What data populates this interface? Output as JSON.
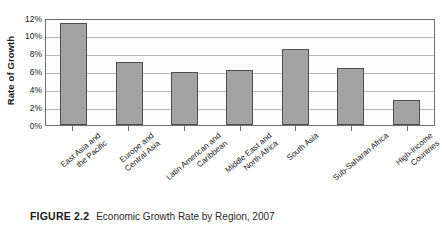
{
  "figure": {
    "number_label": "FIGURE 2.2",
    "caption_text": "Economic Growth Rate by Region, 2007"
  },
  "colors": {
    "bar_fill": "#a3a3a3",
    "bar_stroke": "#4d4d4d",
    "gridline": "#b9b9b9",
    "axis": "#6e6e6e",
    "plot_background": "#fdfdfd",
    "text": "#1b1b1b"
  },
  "chart_data": {
    "type": "bar",
    "title": "Economic Growth Rate by Region, 2007",
    "xlabel": "",
    "ylabel": "Rate of Growth",
    "ylim": [
      0,
      12
    ],
    "ytick_labels": [
      "12%",
      "10%",
      "8%",
      "6%",
      "4%",
      "2%",
      "0%"
    ],
    "ytick_values": [
      12,
      10,
      8,
      6,
      4,
      2,
      0
    ],
    "grid": true,
    "legend": false,
    "value_unit": "percent",
    "categories": [
      "East Asia and the Pacific",
      "Europe and Central Asia",
      "Latin American and Caribbean",
      "Middle East and North Africa",
      "South Asia",
      "Sub-Saharan Africa",
      "High-Income Countries"
    ],
    "category_lines": [
      [
        "East Asia and",
        "the Pacific"
      ],
      [
        "Europe and",
        "Central Asia"
      ],
      [
        "Latin American and",
        "Caribbean"
      ],
      [
        "Middle East and",
        "North Africa"
      ],
      [
        "South Asia",
        ""
      ],
      [
        "Sub-Saharan Africa",
        ""
      ],
      [
        "High-Income",
        "Countries"
      ]
    ],
    "values": [
      11.4,
      7.0,
      5.9,
      6.1,
      8.5,
      6.3,
      2.7
    ]
  }
}
